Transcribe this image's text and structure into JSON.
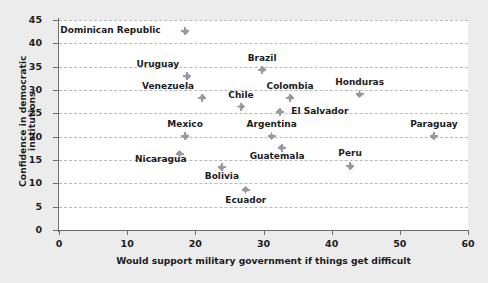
{
  "chart_data": {
    "type": "scatter",
    "title": "",
    "xlabel": "Would support military government if things get difficult",
    "ylabel": "Confidence in democratic institutions",
    "xlim": [
      0,
      60
    ],
    "ylim": [
      0,
      45
    ],
    "xticks": [
      "0",
      "10",
      "20",
      "30",
      "40",
      "50",
      "60"
    ],
    "yticks": [
      "0",
      "5",
      "10",
      "15",
      "20",
      "25",
      "30",
      "35",
      "40",
      "45"
    ],
    "grid": "horizontal-dashed",
    "legend": "none",
    "marker_color": "#8b8b91",
    "points": [
      {
        "label": "Dominican Republic",
        "x": 18.5,
        "y": 42.6,
        "lx": 15.5,
        "ly": 42.6,
        "anchor": "right"
      },
      {
        "label": "Uruguay",
        "x": 18.8,
        "y": 33.0,
        "lx": 18.2,
        "ly": 35.3,
        "anchor": "right"
      },
      {
        "label": "Venezuela",
        "x": 21.0,
        "y": 28.3,
        "lx": 20.4,
        "ly": 30.6,
        "anchor": "right"
      },
      {
        "label": "Brazil",
        "x": 29.8,
        "y": 34.3,
        "lx": 29.8,
        "ly": 36.6,
        "anchor": "center"
      },
      {
        "label": "Chile",
        "x": 26.7,
        "y": 26.4,
        "lx": 26.7,
        "ly": 28.7,
        "anchor": "center"
      },
      {
        "label": "Colombia",
        "x": 33.9,
        "y": 28.3,
        "lx": 33.9,
        "ly": 30.6,
        "anchor": "center"
      },
      {
        "label": "El Salvador",
        "x": 32.4,
        "y": 25.3,
        "lx": 33.5,
        "ly": 25.3,
        "anchor": "left"
      },
      {
        "label": "Honduras",
        "x": 44.1,
        "y": 29.1,
        "lx": 44.1,
        "ly": 31.4,
        "anchor": "center"
      },
      {
        "label": "Paraguay",
        "x": 55.0,
        "y": 20.1,
        "lx": 55.0,
        "ly": 22.6,
        "anchor": "center"
      },
      {
        "label": "Mexico",
        "x": 18.5,
        "y": 20.1,
        "lx": 18.5,
        "ly": 22.6,
        "anchor": "center"
      },
      {
        "label": "Nicaragua",
        "x": 17.7,
        "y": 16.3,
        "lx": 19.3,
        "ly": 15.0,
        "anchor": "right"
      },
      {
        "label": "Bolivia",
        "x": 23.9,
        "y": 13.5,
        "lx": 23.9,
        "ly": 11.3,
        "anchor": "center"
      },
      {
        "label": "Ecuador",
        "x": 27.4,
        "y": 8.6,
        "lx": 27.4,
        "ly": 6.3,
        "anchor": "center"
      },
      {
        "label": "Argentina",
        "x": 31.2,
        "y": 20.1,
        "lx": 31.2,
        "ly": 22.6,
        "anchor": "center"
      },
      {
        "label": "Guatemala",
        "x": 32.7,
        "y": 17.6,
        "lx": 32.0,
        "ly": 15.6,
        "anchor": "center"
      },
      {
        "label": "Peru",
        "x": 42.7,
        "y": 13.7,
        "lx": 42.7,
        "ly": 16.2,
        "anchor": "center"
      }
    ]
  }
}
